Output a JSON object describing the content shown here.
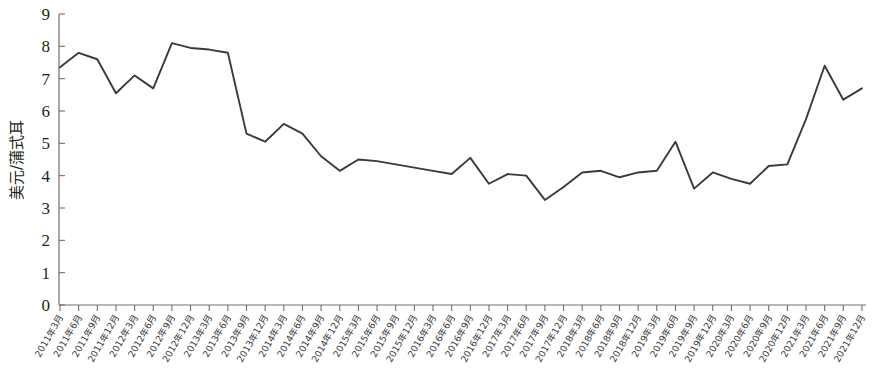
{
  "chart_data": {
    "type": "line",
    "title": "",
    "xlabel": "",
    "ylabel": "美元/蒲式耳",
    "ylim": [
      0,
      9
    ],
    "ytick_step": 1,
    "yticks": [
      "0",
      "1",
      "2",
      "3",
      "4",
      "5",
      "6",
      "7",
      "8",
      "9"
    ],
    "grid": false,
    "legend": "none",
    "line_color": "#3a3a3a",
    "axis_color": "#6e6e6e",
    "categories": [
      "2011年3月",
      "2011年6月",
      "2011年9月",
      "2011年12月",
      "2012年3月",
      "2012年6月",
      "2012年9月",
      "2012年12月",
      "2013年3月",
      "2013年6月",
      "2013年9月",
      "2013年12月",
      "2014年3月",
      "2014年6月",
      "2014年9月",
      "2014年12月",
      "2015年3月",
      "2015年6月",
      "2015年9月",
      "2015年12月",
      "2016年3月",
      "2016年6月",
      "2016年9月",
      "2016年12月",
      "2017年3月",
      "2017年6月",
      "2017年9月",
      "2017年12月",
      "2018年3月",
      "2018年6月",
      "2018年9月",
      "2018年12月",
      "2019年3月",
      "2019年6月",
      "2019年9月",
      "2019年12月",
      "2020年3月",
      "2020年6月",
      "2020年9月",
      "2020年12月",
      "2021年3月",
      "2021年6月",
      "2021年9月",
      "2021年12月"
    ],
    "values": [
      7.35,
      7.8,
      7.6,
      6.55,
      7.1,
      6.7,
      8.1,
      7.95,
      7.9,
      7.8,
      5.3,
      5.05,
      5.6,
      5.3,
      4.6,
      4.15,
      4.5,
      4.45,
      4.35,
      4.25,
      4.15,
      4.05,
      4.55,
      3.75,
      4.05,
      4.0,
      3.25,
      3.65,
      4.1,
      4.15,
      3.95,
      4.1,
      4.15,
      5.05,
      3.6,
      4.1,
      3.9,
      3.75,
      4.3,
      4.35,
      5.75,
      7.4,
      6.35,
      6.7
    ]
  },
  "layout": {
    "plot_left": 59,
    "plot_right": 866,
    "plot_top": 14,
    "plot_bottom": 305,
    "first_x": 60,
    "x_step": 18.65
  }
}
